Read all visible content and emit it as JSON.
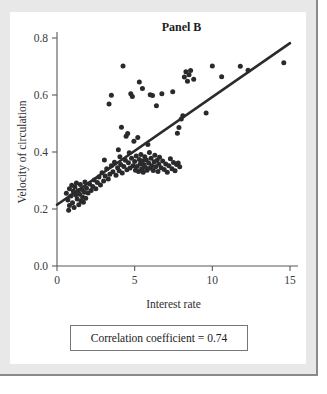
{
  "figure": {
    "panel_title": "Panel B",
    "correlation_note": "Correlation coefficient = 0.74"
  },
  "chart_data": {
    "type": "scatter",
    "title": "Panel B",
    "xlabel": "Interest rate",
    "ylabel": "Velocity of circulation",
    "xlim": [
      0,
      15
    ],
    "ylim": [
      0.0,
      0.8
    ],
    "xticks": [
      0,
      5,
      10,
      15
    ],
    "xtick_labels": [
      "0",
      "5",
      "10",
      "15"
    ],
    "yticks": [
      0.0,
      0.2,
      0.4,
      0.6,
      0.8
    ],
    "ytick_labels": [
      "0.0",
      "0.2",
      "0.4",
      "0.6",
      "0.8"
    ],
    "grid": false,
    "legend": false,
    "annotations": [
      "Correlation coefficient = 0.74"
    ],
    "marker": {
      "shape": "circle",
      "color": "#2a2a2c",
      "size": 5
    },
    "trendline": {
      "type": "linear-fit",
      "color": "#2b2b2d",
      "x": [
        0.0,
        15.0
      ],
      "y": [
        0.215,
        0.782
      ]
    },
    "points": [
      [
        0.6,
        0.255
      ],
      [
        0.7,
        0.232
      ],
      [
        0.75,
        0.196
      ],
      [
        0.8,
        0.212
      ],
      [
        0.8,
        0.271
      ],
      [
        0.9,
        0.246
      ],
      [
        0.95,
        0.283
      ],
      [
        1.0,
        0.222
      ],
      [
        1.05,
        0.262
      ],
      [
        1.1,
        0.205
      ],
      [
        1.15,
        0.277
      ],
      [
        1.2,
        0.249
      ],
      [
        1.25,
        0.291
      ],
      [
        1.3,
        0.235
      ],
      [
        1.35,
        0.264
      ],
      [
        1.4,
        0.215
      ],
      [
        1.45,
        0.252
      ],
      [
        1.5,
        0.286
      ],
      [
        1.55,
        0.228
      ],
      [
        1.6,
        0.268
      ],
      [
        1.65,
        0.241
      ],
      [
        1.7,
        0.224
      ],
      [
        1.75,
        0.259
      ],
      [
        1.8,
        0.295
      ],
      [
        1.85,
        0.238
      ],
      [
        1.9,
        0.273
      ],
      [
        2.0,
        0.256
      ],
      [
        2.1,
        0.288
      ],
      [
        2.2,
        0.265
      ],
      [
        2.3,
        0.279
      ],
      [
        2.4,
        0.302
      ],
      [
        2.5,
        0.271
      ],
      [
        2.6,
        0.293
      ],
      [
        2.7,
        0.312
      ],
      [
        2.8,
        0.284
      ],
      [
        2.9,
        0.327
      ],
      [
        3.0,
        0.298
      ],
      [
        3.05,
        0.372
      ],
      [
        3.1,
        0.316
      ],
      [
        3.2,
        0.341
      ],
      [
        3.3,
        0.305
      ],
      [
        3.35,
        0.568
      ],
      [
        3.4,
        0.322
      ],
      [
        3.5,
        0.352
      ],
      [
        3.5,
        0.599
      ],
      [
        3.6,
        0.331
      ],
      [
        3.7,
        0.364
      ],
      [
        3.8,
        0.318
      ],
      [
        3.9,
        0.345
      ],
      [
        3.95,
        0.408
      ],
      [
        4.0,
        0.334
      ],
      [
        4.05,
        0.383
      ],
      [
        4.1,
        0.356
      ],
      [
        4.15,
        0.487
      ],
      [
        4.2,
        0.326
      ],
      [
        4.25,
        0.702
      ],
      [
        4.3,
        0.349
      ],
      [
        4.4,
        0.371
      ],
      [
        4.45,
        0.455
      ],
      [
        4.5,
        0.338
      ],
      [
        4.55,
        0.465
      ],
      [
        4.6,
        0.362
      ],
      [
        4.65,
        0.397
      ],
      [
        4.7,
        0.344
      ],
      [
        4.75,
        0.604
      ],
      [
        4.8,
        0.378
      ],
      [
        4.85,
        0.595
      ],
      [
        4.9,
        0.352
      ],
      [
        4.95,
        0.438
      ],
      [
        5.0,
        0.367
      ],
      [
        5.05,
        0.336
      ],
      [
        5.1,
        0.386
      ],
      [
        5.15,
        0.349
      ],
      [
        5.2,
        0.451
      ],
      [
        5.25,
        0.332
      ],
      [
        5.3,
        0.374
      ],
      [
        5.3,
        0.646
      ],
      [
        5.35,
        0.358
      ],
      [
        5.4,
        0.391
      ],
      [
        5.45,
        0.341
      ],
      [
        5.5,
        0.368
      ],
      [
        5.5,
        0.623
      ],
      [
        5.55,
        0.329
      ],
      [
        5.6,
        0.355
      ],
      [
        5.65,
        0.383
      ],
      [
        5.7,
        0.346
      ],
      [
        5.75,
        0.372
      ],
      [
        5.8,
        0.336
      ],
      [
        5.85,
        0.426
      ],
      [
        5.9,
        0.361
      ],
      [
        5.95,
        0.398
      ],
      [
        6.0,
        0.344
      ],
      [
        6.0,
        0.601
      ],
      [
        6.05,
        0.378
      ],
      [
        6.1,
        0.352
      ],
      [
        6.15,
        0.598
      ],
      [
        6.2,
        0.335
      ],
      [
        6.25,
        0.366
      ],
      [
        6.3,
        0.389
      ],
      [
        6.35,
        0.348
      ],
      [
        6.4,
        0.562
      ],
      [
        6.45,
        0.371
      ],
      [
        6.5,
        0.332
      ],
      [
        6.55,
        0.357
      ],
      [
        6.6,
        0.382
      ],
      [
        6.7,
        0.345
      ],
      [
        6.75,
        0.604
      ],
      [
        6.8,
        0.368
      ],
      [
        6.9,
        0.339
      ],
      [
        7.0,
        0.358
      ],
      [
        7.1,
        0.329
      ],
      [
        7.2,
        0.352
      ],
      [
        7.3,
        0.376
      ],
      [
        7.4,
        0.341
      ],
      [
        7.45,
        0.611
      ],
      [
        7.5,
        0.363
      ],
      [
        7.6,
        0.334
      ],
      [
        7.7,
        0.356
      ],
      [
        7.75,
        0.466
      ],
      [
        7.8,
        0.361
      ],
      [
        7.85,
        0.486
      ],
      [
        7.9,
        0.348
      ],
      [
        8.0,
        0.516
      ],
      [
        8.1,
        0.527
      ],
      [
        8.2,
        0.663
      ],
      [
        8.3,
        0.682
      ],
      [
        8.4,
        0.648
      ],
      [
        8.5,
        0.671
      ],
      [
        8.6,
        0.686
      ],
      [
        8.8,
        0.655
      ],
      [
        9.6,
        0.537
      ],
      [
        10.0,
        0.702
      ],
      [
        10.6,
        0.664
      ],
      [
        11.8,
        0.701
      ],
      [
        12.3,
        0.687
      ],
      [
        14.6,
        0.713
      ]
    ]
  }
}
